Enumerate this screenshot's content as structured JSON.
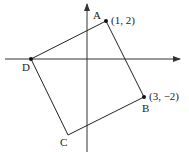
{
  "diagram": {
    "type": "coordinate-plane-square",
    "axes": {
      "x_axis_y": 59,
      "x_axis_from": 5,
      "x_axis_to": 180,
      "y_axis_x": 87,
      "y_axis_from": 152,
      "y_axis_to": 4
    },
    "vertices": [
      {
        "name": "A",
        "px": 106,
        "py": 21,
        "label": "A",
        "coord_label": "(1, 2)"
      },
      {
        "name": "B",
        "px": 144,
        "py": 97,
        "label": "B",
        "coord_label": "(3, −2)"
      },
      {
        "name": "C",
        "px": 68,
        "py": 135,
        "label": "C",
        "coord_label": ""
      },
      {
        "name": "D",
        "px": 31,
        "py": 59,
        "label": "D",
        "coord_label": ""
      }
    ],
    "labels": {
      "A": "A",
      "B": "B",
      "C": "C",
      "D": "D",
      "A_coord": "(1, 2)",
      "B_coord": "(3, −2)"
    },
    "colors": {
      "stroke": "#222222",
      "axis": "#333333",
      "background": "#ffffff"
    }
  }
}
